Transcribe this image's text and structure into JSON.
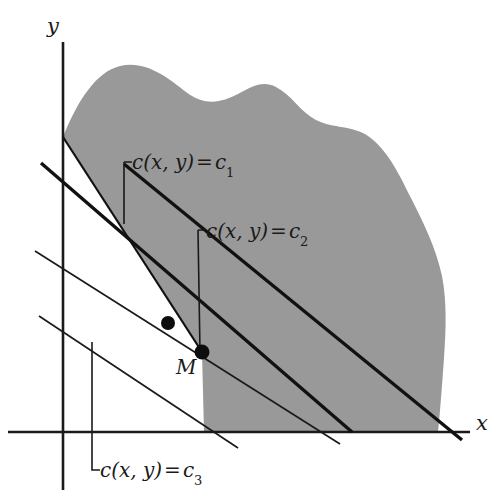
{
  "figure": {
    "type": "diagram",
    "width": 497,
    "height": 502,
    "background_color": "#ffffff",
    "region_fill_color": "#999999",
    "line_color": "#111111",
    "text_color": "#1a1a1a"
  },
  "axes": {
    "x_label": "x",
    "y_label": "y",
    "x_axis": {
      "y": 432,
      "x_start": 8,
      "x_end": 470
    },
    "y_axis": {
      "x": 63,
      "y_start": 42,
      "y_end": 490
    },
    "ticks": false,
    "grid": false
  },
  "labels": {
    "c1": {
      "text_prefix": "c(x, y)",
      "operator": "=",
      "value": "c",
      "subscript": "1"
    },
    "c2": {
      "text_prefix": "c(x, y)",
      "operator": "=",
      "value": "c",
      "subscript": "2"
    },
    "c3": {
      "text_prefix": "c(x, y)",
      "operator": "=",
      "value": "c",
      "subscript": "3"
    },
    "optimal_point": "M"
  },
  "level_lines": [
    {
      "name": "c1",
      "style": "thick",
      "label": "c(x, y) = c1",
      "from": {
        "x": 41,
        "y": 163
      },
      "to": {
        "x": 352,
        "y": 432
      }
    },
    {
      "name": "c2",
      "style": "thick",
      "label": "c(x, y) = c2",
      "passes_through": "M",
      "from": {
        "x": 124,
        "y": 164
      },
      "to": {
        "x": 462,
        "y": 440
      }
    },
    {
      "name": "c2-thin",
      "style": "thin",
      "from": {
        "x": 35,
        "y": 251
      },
      "to": {
        "x": 340,
        "y": 444
      }
    },
    {
      "name": "c3",
      "style": "thin",
      "label": "c(x, y) = c3",
      "from": {
        "x": 39,
        "y": 316
      },
      "to": {
        "x": 238,
        "y": 448
      }
    }
  ],
  "points": [
    {
      "name": "vertex-upper",
      "x": 168,
      "y": 323,
      "label": ""
    },
    {
      "name": "optimum",
      "x": 202,
      "y": 352,
      "label": "M"
    }
  ],
  "leaders": [
    {
      "name": "leader-c1",
      "corner_x": 124,
      "corner_y": 162,
      "end_y": 224
    },
    {
      "name": "leader-c2",
      "corner_x": 198,
      "corner_y": 230,
      "end_y": 352
    },
    {
      "name": "leader-c3",
      "corner_x": 92,
      "corner_y": 342,
      "end_y": 470
    }
  ],
  "region": {
    "name": "feasible-region",
    "fill": "#999999",
    "note": "Shaded set bounded above by a wavy free-form curve, on the left by a straight edge from the y-axis down to M, and below by the x-axis"
  }
}
